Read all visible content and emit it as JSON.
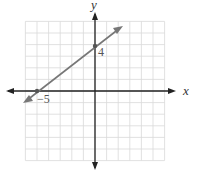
{
  "chart_data": {
    "type": "line",
    "title": "",
    "xlabel": "x",
    "ylabel": "y",
    "xlim": [
      -6,
      6
    ],
    "ylim": [
      -6,
      6
    ],
    "grid": true,
    "series": [
      {
        "name": "line",
        "equation": "y = 0.8x + 4",
        "x": [
          -6.3,
          4.4
        ],
        "y": [
          -1.04,
          7.52
        ],
        "marked_points": [
          {
            "x": -5,
            "y": 0,
            "label": "-5"
          },
          {
            "x": 0,
            "y": 4,
            "label": "4"
          }
        ]
      }
    ],
    "annotations": [
      "-5",
      "4"
    ]
  },
  "axes": {
    "x_label": "x",
    "y_label": "y"
  },
  "points": {
    "x_intercept_label": "−5",
    "y_intercept_label": "4"
  },
  "colors": {
    "grid": "#d9d9d9",
    "axis": "#222222",
    "line": "#777777",
    "point": "#555555"
  }
}
